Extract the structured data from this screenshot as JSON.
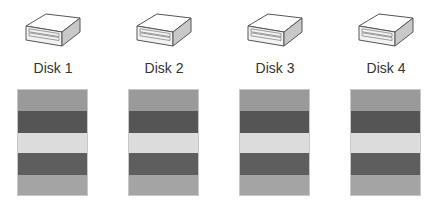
{
  "disks": [
    {
      "label": "Disk 1",
      "x": 17
    },
    {
      "label": "Disk 2",
      "x": 128
    },
    {
      "label": "Disk 3",
      "x": 239
    },
    {
      "label": "Disk 4",
      "x": 350
    }
  ],
  "stripes": [
    {
      "name": "stripe-1",
      "color": "#9a9a9a",
      "height": 21
    },
    {
      "name": "stripe-2",
      "color": "#555555",
      "height": 22
    },
    {
      "name": "stripe-3",
      "color": "#dcdcdc",
      "height": 20
    },
    {
      "name": "stripe-4",
      "color": "#5e5e5e",
      "height": 22
    },
    {
      "name": "stripe-5",
      "color": "#a4a4a4",
      "height": 22
    }
  ]
}
